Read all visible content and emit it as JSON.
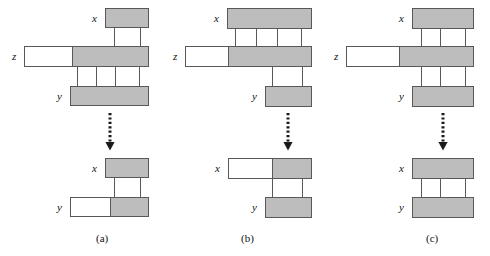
{
  "figure": {
    "background": "#ffffff",
    "box_fill": "#bdbdbd",
    "box_empty_fill": "#ffffff",
    "stroke": "#585858"
  },
  "panels": [
    {
      "id": "a",
      "caption": "(a)",
      "top_diagram": {
        "nodes": [
          {
            "name": "x",
            "label": "x"
          },
          {
            "name": "z",
            "label": "z"
          },
          {
            "name": "y",
            "label": "y"
          }
        ]
      },
      "bottom_diagram": {
        "nodes": [
          {
            "name": "x",
            "label": "x"
          },
          {
            "name": "y",
            "label": "y"
          }
        ]
      }
    },
    {
      "id": "b",
      "caption": "(b)",
      "top_diagram": {
        "nodes": [
          {
            "name": "x",
            "label": "x"
          },
          {
            "name": "z",
            "label": "z"
          },
          {
            "name": "y",
            "label": "y"
          }
        ]
      },
      "bottom_diagram": {
        "nodes": [
          {
            "name": "x",
            "label": "x"
          },
          {
            "name": "y",
            "label": "y"
          }
        ]
      }
    },
    {
      "id": "c",
      "caption": "(c)",
      "top_diagram": {
        "nodes": [
          {
            "name": "x",
            "label": "x"
          },
          {
            "name": "z",
            "label": "z"
          },
          {
            "name": "y",
            "label": "y"
          }
        ]
      },
      "bottom_diagram": {
        "nodes": [
          {
            "name": "x",
            "label": "x"
          },
          {
            "name": "y",
            "label": "y"
          }
        ]
      }
    }
  ]
}
